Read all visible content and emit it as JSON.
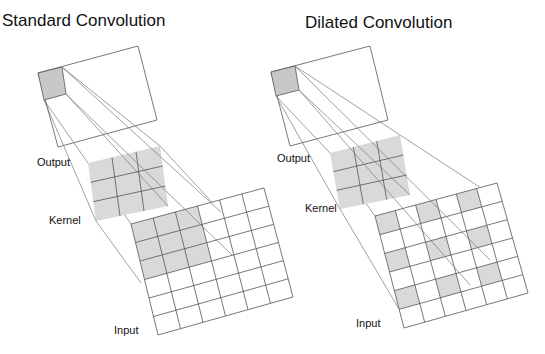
{
  "panels": [
    {
      "id": "standard",
      "title": "Standard Convolution",
      "labels": {
        "output": "Output",
        "kernel": "Kernel",
        "input": "Input"
      },
      "output": {
        "quad": [
          [
            38,
            73
          ],
          [
            138,
            46
          ],
          [
            157,
            120
          ],
          [
            58,
            147
          ]
        ],
        "cell": [
          [
            38,
            73
          ],
          [
            62,
            67
          ],
          [
            66,
            94
          ],
          [
            44,
            100
          ]
        ]
      },
      "kernel": {
        "quad": [
          [
            88,
            163
          ],
          [
            160,
            146
          ],
          [
            168,
            206
          ],
          [
            96,
            221
          ]
        ],
        "rows": 3,
        "cols": 3
      },
      "input": {
        "quad": [
          [
            131,
            224
          ],
          [
            264,
            188
          ],
          [
            293,
            297
          ],
          [
            158,
            335
          ]
        ],
        "rows": 6,
        "cols": 6,
        "shaded": [
          [
            0,
            0
          ],
          [
            0,
            1
          ],
          [
            0,
            2
          ],
          [
            1,
            0
          ],
          [
            1,
            1
          ],
          [
            1,
            2
          ],
          [
            2,
            0
          ],
          [
            2,
            1
          ],
          [
            2,
            2
          ]
        ]
      }
    },
    {
      "id": "dilated",
      "title": "Dilated Convolution",
      "labels": {
        "output": "Output",
        "kernel": "Kernel",
        "input": "Input"
      },
      "output": {
        "quad": [
          [
            271,
            72
          ],
          [
            370,
            46
          ],
          [
            388,
            120
          ],
          [
            290,
            146
          ]
        ],
        "cell": [
          [
            271,
            72
          ],
          [
            295,
            66
          ],
          [
            299,
            90
          ],
          [
            276,
            96
          ]
        ]
      },
      "kernel": {
        "quad": [
          [
            330,
            153
          ],
          [
            400,
            135
          ],
          [
            410,
            195
          ],
          [
            340,
            209
          ]
        ],
        "rows": 3,
        "cols": 3
      },
      "input": {
        "quad": [
          [
            375,
            216
          ],
          [
            497,
            183
          ],
          [
            528,
            293
          ],
          [
            404,
            328
          ]
        ],
        "rows": 6,
        "cols": 6,
        "shaded": [
          [
            0,
            0
          ],
          [
            0,
            2
          ],
          [
            0,
            4
          ],
          [
            2,
            0
          ],
          [
            2,
            2
          ],
          [
            2,
            4
          ],
          [
            4,
            0
          ],
          [
            4,
            2
          ],
          [
            4,
            4
          ]
        ]
      }
    }
  ],
  "colors": {
    "shade": "#d9d9d9",
    "cell_shade": "#c8c8c8",
    "line": "#555555"
  }
}
